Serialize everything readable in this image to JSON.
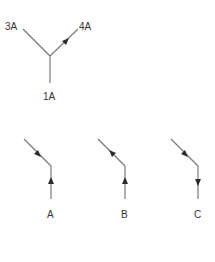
{
  "junction": {
    "branches": [
      {
        "label": "3A",
        "direction": "none"
      },
      {
        "label": "4A",
        "direction": "outward"
      },
      {
        "label": "1A",
        "direction": "none"
      }
    ]
  },
  "options": [
    {
      "label": "A",
      "diagonal_arrow": "into-junction",
      "vertical_arrow": "into-junction"
    },
    {
      "label": "B",
      "diagonal_arrow": "away-from-junction",
      "vertical_arrow": "into-junction"
    },
    {
      "label": "C",
      "diagonal_arrow": "into-junction",
      "vertical_arrow": "away-from-junction"
    }
  ],
  "colors": {
    "line": "#7a7a7a",
    "arrow": "#2a2a2a",
    "text": "#333333"
  }
}
